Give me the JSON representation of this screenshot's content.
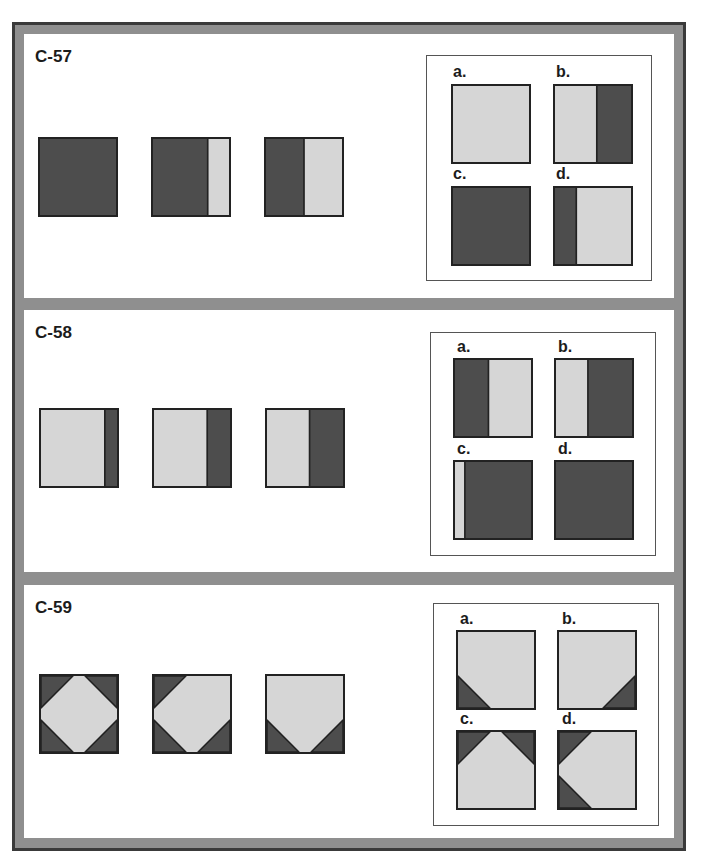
{
  "colors": {
    "dark": "#4d4d4d",
    "light": "#d6d6d6",
    "frame": "#8f8f8f",
    "outline": "#222222"
  },
  "problems": [
    {
      "id": "C-57",
      "sequence": [
        {
          "kind": "vsplit",
          "left": "dark",
          "split": 1.0
        },
        {
          "kind": "vsplit",
          "left": "dark",
          "split": 0.72
        },
        {
          "kind": "vsplit",
          "left": "dark",
          "split": 0.5
        }
      ],
      "options": [
        {
          "label": "a.",
          "kind": "vsplit",
          "left": "light",
          "split": 1.0
        },
        {
          "label": "b.",
          "kind": "vsplit",
          "left": "light",
          "split": 0.55
        },
        {
          "label": "c.",
          "kind": "vsplit",
          "left": "dark",
          "split": 1.0
        },
        {
          "label": "d.",
          "kind": "vsplit",
          "left": "dark",
          "split": 0.28
        }
      ]
    },
    {
      "id": "C-58",
      "sequence": [
        {
          "kind": "vsplit",
          "left": "light",
          "split": 0.84
        },
        {
          "kind": "vsplit",
          "left": "light",
          "split": 0.7
        },
        {
          "kind": "vsplit",
          "left": "light",
          "split": 0.56
        }
      ],
      "options": [
        {
          "label": "a.",
          "kind": "vsplit",
          "left": "dark",
          "split": 0.44
        },
        {
          "label": "b.",
          "kind": "vsplit",
          "left": "light",
          "split": 0.42
        },
        {
          "label": "c.",
          "kind": "vsplit",
          "left": "light",
          "split": 0.13
        },
        {
          "label": "d.",
          "kind": "vsplit",
          "left": "dark",
          "split": 1.0
        }
      ]
    },
    {
      "id": "C-59",
      "sequence": [
        {
          "kind": "corners",
          "corners": [
            "tl",
            "tr",
            "bl",
            "br"
          ]
        },
        {
          "kind": "corners",
          "corners": [
            "tl",
            "bl",
            "br"
          ]
        },
        {
          "kind": "corners",
          "corners": [
            "bl",
            "br"
          ]
        }
      ],
      "options": [
        {
          "label": "a.",
          "kind": "corners",
          "corners": [
            "bl"
          ]
        },
        {
          "label": "b.",
          "kind": "corners",
          "corners": [
            "br"
          ]
        },
        {
          "label": "c.",
          "kind": "corners",
          "corners": [
            "tl",
            "tr"
          ]
        },
        {
          "label": "d.",
          "kind": "corners",
          "corners": [
            "tl",
            "bl"
          ]
        }
      ]
    }
  ]
}
